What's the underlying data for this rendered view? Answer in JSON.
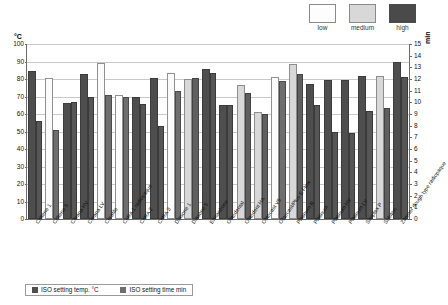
{
  "top_legend": {
    "items": [
      {
        "label": "low",
        "color": "#fdfdfd"
      },
      {
        "label": "medium",
        "color": "#d8d8d8"
      },
      {
        "label": "high",
        "color": "#4a4a4a"
      }
    ]
  },
  "legend": {
    "items": [
      {
        "label": "ISO setting temp. °C",
        "color": "#4e4e4e"
      },
      {
        "label": "ISO setting time min",
        "color": "#6e6e6e"
      }
    ]
  },
  "axes": {
    "left_unit": "°C",
    "right_unit": "min",
    "left_ticks": [
      "0",
      "10",
      "20",
      "30",
      "40",
      "50",
      "60",
      "70",
      "80",
      "90",
      "100"
    ],
    "right_ticks": [
      "0",
      "1",
      "2",
      "3",
      "4",
      "5",
      "6",
      "7",
      "8",
      "9",
      "10",
      "11",
      "12",
      "13",
      "14",
      "15"
    ]
  },
  "chart_data": {
    "type": "bar",
    "title": "",
    "xlabel": "",
    "ylabel": "°C",
    "y2label": "min",
    "ylim": [
      0,
      100
    ],
    "y2lim": [
      0,
      15
    ],
    "grid": true,
    "legend_position": "bottom",
    "viscosity_legend": [
      "low",
      "medium",
      "high"
    ],
    "categories": [
      "Coltene 1",
      "Coltene 5",
      "Cerana HV",
      "Cerana LV",
      "Cerafile",
      "CeRA 1 radiopaque",
      "CeRA 2",
      "CeRA 3",
      "Diasone 1",
      "Diasone 5",
      "Ermanbone",
      "Obtodental",
      "Obtodent HA",
      "Obtocast V5",
      "Obtocast/Plus E Flow",
      "Platinum R",
      "Platinum",
      "Platinum HV",
      "Platinum LV",
      "Simplex P",
      "Subiton",
      "Zimmer dough type radiopaque"
    ],
    "viscosity": [
      "high",
      "low",
      "high",
      "high",
      "low",
      "low",
      "high",
      "high",
      "low",
      "medium",
      "high",
      "high",
      "medium",
      "medium",
      "low",
      "medium",
      "high",
      "high",
      "high",
      "high",
      "medium",
      "high"
    ],
    "series": [
      {
        "name": "ISO setting temp. °C",
        "unit": "°C",
        "axis": "left",
        "values": [
          84.5,
          80.5,
          66.5,
          83.0,
          89.0,
          71.0,
          70.0,
          80.5,
          83.5,
          80.0,
          86.0,
          65.0,
          76.5,
          61.0,
          81.0,
          88.5,
          77.0,
          79.5,
          79.5,
          82.0,
          81.5,
          90.0
        ]
      },
      {
        "name": "ISO setting time min",
        "unit": "min",
        "axis": "right",
        "values": [
          8.4,
          7.6,
          10.0,
          10.5,
          10.6,
          10.5,
          9.9,
          8.0,
          11.0,
          12.1,
          12.5,
          9.8,
          10.8,
          9.0,
          11.8,
          12.4,
          9.8,
          7.5,
          7.4,
          9.3,
          9.5,
          12.2
        ]
      }
    ]
  }
}
